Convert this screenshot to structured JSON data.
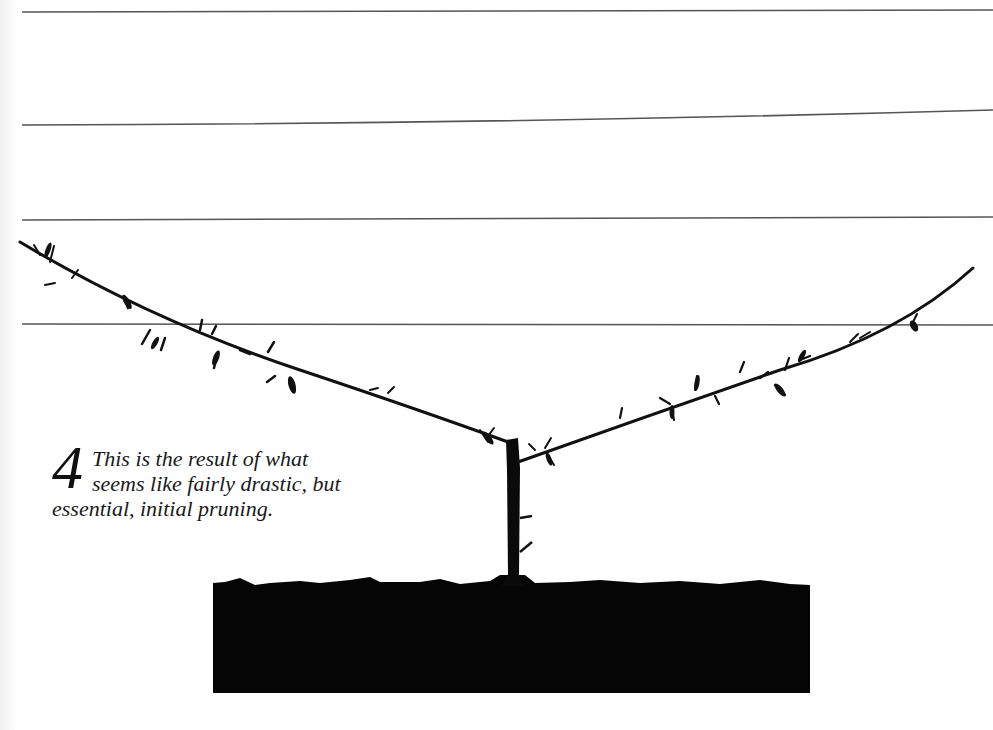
{
  "figure": {
    "step_number": "4",
    "caption_lines": [
      "This is the result of what",
      "seems like fairly drastic, but",
      "essential, initial pruning."
    ],
    "caption_full": "This is the result of what seems like fairly drastic, but essential, initial pruning."
  },
  "illustration": {
    "subject": "espalier tree after initial pruning",
    "wires_count": 4,
    "elements": [
      "support-wires",
      "trunk",
      "left-arm",
      "right-arm",
      "soil-block"
    ],
    "colors": {
      "ink": "#111111",
      "wire": "#555555",
      "paper": "#ffffff",
      "soil": "#050505"
    }
  }
}
